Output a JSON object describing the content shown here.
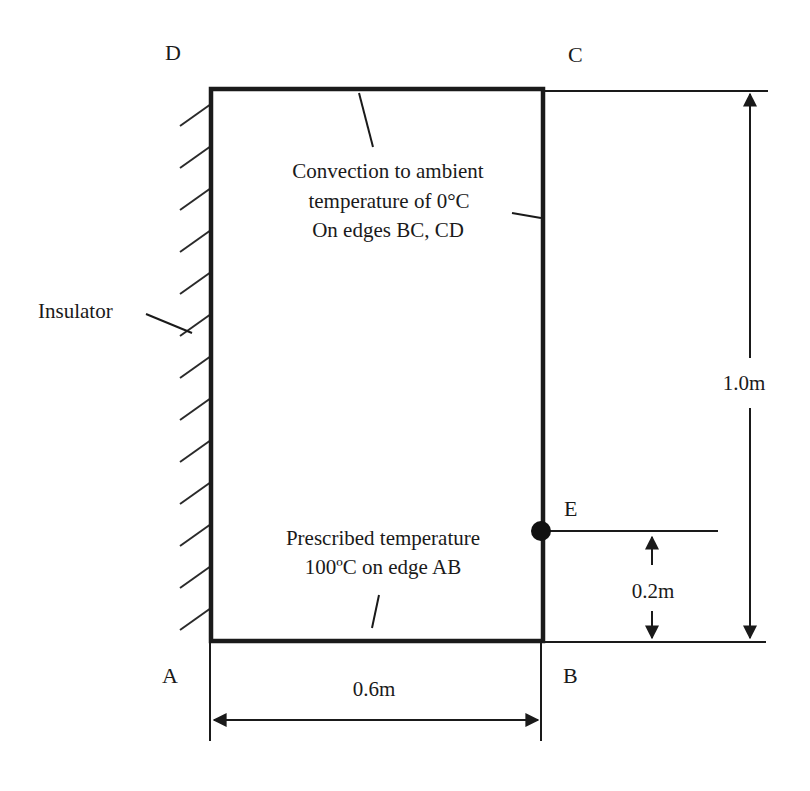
{
  "diagram": {
    "type": "heat-transfer boundary conditions",
    "corners": {
      "A": "A",
      "B": "B",
      "C": "C",
      "D": "D"
    },
    "point_E": "E",
    "annotations": {
      "convection": {
        "line1": "Convection to ambient",
        "line2": "temperature of 0°C",
        "line3": "On edges BC, CD"
      },
      "prescribed": {
        "line1": "Prescribed temperature",
        "line2": "100ºC on edge AB"
      },
      "insulator": "Insulator"
    },
    "dimensions": {
      "width": "0.6m",
      "height": "1.0m",
      "e_offset": "0.2m"
    },
    "colors": {
      "line": "#1a1a1a",
      "background": "#ffffff"
    }
  }
}
